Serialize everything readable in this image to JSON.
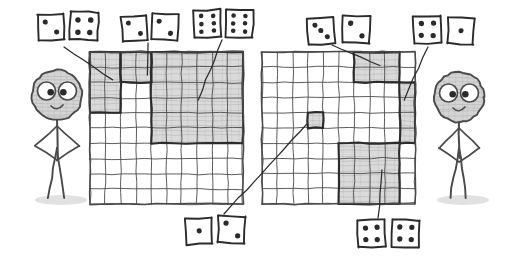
{
  "scene": {
    "title": "Two hand-drawn 10x10 grids with shaded rectangles labelled by dice pairs",
    "style": "pencil-sketch",
    "bg_color": "#ffffff",
    "ink_color": "#4a4a4a",
    "shade_color": "#b9b9b9",
    "dark_ink": "#2b2b2b",
    "width": 512,
    "height": 257
  },
  "figures": [
    {
      "name": "left-stick-figure",
      "side": "left",
      "cx": 57,
      "head_cy": 95,
      "head_r": 25,
      "expression": "smiling"
    },
    {
      "name": "right-stick-figure",
      "side": "right",
      "cx": 459,
      "head_cy": 97,
      "head_r": 25,
      "expression": "smiling"
    }
  ],
  "grids": [
    {
      "name": "left-grid",
      "x": 90,
      "y": 52,
      "w": 153,
      "h": 152,
      "cols": 10,
      "rows": 10,
      "regions": [
        {
          "name": "region-2x4",
          "col": 0,
          "row": 0,
          "cols": 2,
          "rows": 4,
          "shaded": true,
          "dice": "top-left-pair"
        },
        {
          "name": "region-2x2",
          "col": 2,
          "row": 0,
          "cols": 2,
          "rows": 2,
          "shaded": true,
          "dice": "top-left-center-pair"
        },
        {
          "name": "region-6x6",
          "col": 4,
          "row": 0,
          "cols": 6,
          "rows": 6,
          "shaded": true,
          "dice": "top-center-pair"
        }
      ]
    },
    {
      "name": "right-grid",
      "x": 262,
      "y": 52,
      "w": 153,
      "h": 152,
      "cols": 10,
      "rows": 10,
      "regions": [
        {
          "name": "region-3x2",
          "col": 6,
          "row": 0,
          "cols": 3,
          "rows": 2,
          "shaded": true,
          "dice": "top-right-center-pair"
        },
        {
          "name": "region-1x4",
          "col": 9,
          "row": 2,
          "cols": 1,
          "rows": 4,
          "shaded": true,
          "dice": "top-right-pair"
        },
        {
          "name": "region-1x1",
          "col": 3,
          "row": 4,
          "cols": 1,
          "rows": 1,
          "shaded": true,
          "dice": "bottom-center-pair"
        },
        {
          "name": "region-4x4",
          "col": 5,
          "row": 6,
          "cols": 4,
          "rows": 4,
          "shaded": true,
          "dice": "bottom-right-pair"
        }
      ]
    }
  ],
  "dice_groups": [
    {
      "name": "top-left-pair",
      "position": "top-left",
      "dice": [
        {
          "pips": 2,
          "x": 38,
          "y": 14,
          "size": 26,
          "tilt": -3
        },
        {
          "pips": 4,
          "x": 70,
          "y": 12,
          "size": 28,
          "tilt": 2
        }
      ],
      "leader_from": [
        64,
        47
      ],
      "leader_to": [
        113,
        80
      ]
    },
    {
      "name": "top-left-center-pair",
      "position": "top-left-center",
      "dice": [
        {
          "pips": 2,
          "x": 122,
          "y": 16,
          "size": 25,
          "tilt": -4
        },
        {
          "pips": 2,
          "x": 152,
          "y": 14,
          "size": 26,
          "tilt": 3
        }
      ],
      "leader_from": [
        148,
        43
      ],
      "leader_to": [
        148,
        75
      ]
    },
    {
      "name": "top-center-pair",
      "position": "top-center",
      "dice": [
        {
          "pips": 6,
          "x": 194,
          "y": 10,
          "size": 27,
          "tilt": -2
        },
        {
          "pips": 6,
          "x": 226,
          "y": 10,
          "size": 27,
          "tilt": 2
        }
      ],
      "leader_from": [
        222,
        40
      ],
      "leader_to": [
        198,
        100
      ]
    },
    {
      "name": "top-right-center-pair",
      "position": "top-right-center",
      "dice": [
        {
          "pips": 3,
          "x": 308,
          "y": 18,
          "size": 26,
          "tilt": -3
        },
        {
          "pips": 2,
          "x": 343,
          "y": 16,
          "size": 27,
          "tilt": 2
        }
      ],
      "leader_from": [
        332,
        45
      ],
      "leader_to": [
        380,
        66
      ]
    },
    {
      "name": "top-right-pair",
      "position": "top-right",
      "dice": [
        {
          "pips": 4,
          "x": 414,
          "y": 16,
          "size": 27,
          "tilt": -2
        },
        {
          "pips": 1,
          "x": 448,
          "y": 18,
          "size": 26,
          "tilt": 3
        }
      ],
      "leader_from": [
        428,
        47
      ],
      "leader_to": [
        404,
        100
      ]
    },
    {
      "name": "bottom-center-pair",
      "position": "bottom-center",
      "dice": [
        {
          "pips": 1,
          "x": 186,
          "y": 218,
          "size": 26,
          "tilt": -2
        },
        {
          "pips": 2,
          "x": 218,
          "y": 216,
          "size": 27,
          "tilt": 2
        }
      ],
      "leader_from": [
        224,
        214
      ],
      "leader_to": [
        307,
        124
      ]
    },
    {
      "name": "bottom-right-pair",
      "position": "bottom-right",
      "dice": [
        {
          "pips": 4,
          "x": 358,
          "y": 220,
          "size": 27,
          "tilt": -2
        },
        {
          "pips": 4,
          "x": 392,
          "y": 220,
          "size": 27,
          "tilt": 2
        }
      ],
      "leader_from": [
        378,
        218
      ],
      "leader_to": [
        382,
        170
      ]
    }
  ]
}
